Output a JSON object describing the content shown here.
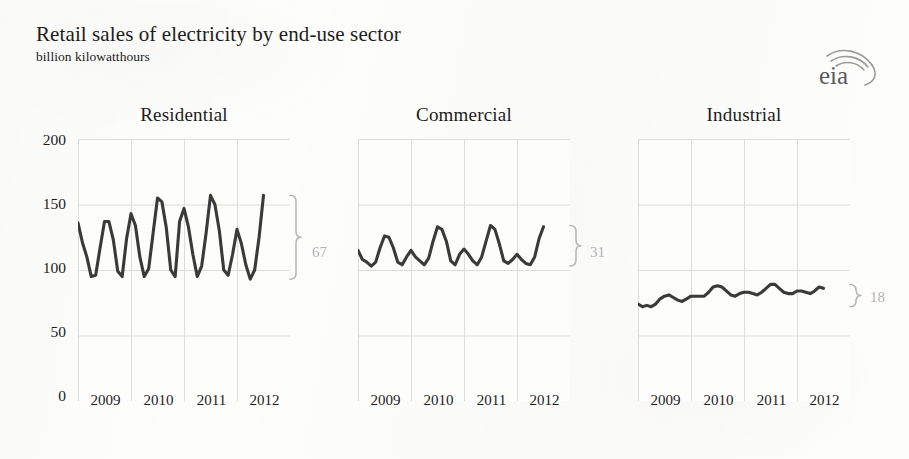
{
  "header": {
    "title": "Retail sales of electricity by end-use sector",
    "subtitle": "billion kilowatthours",
    "logo_text": "eia",
    "logo_name": "eia-logo"
  },
  "axis": {
    "y_ticks": [
      "200",
      "150",
      "100",
      "50",
      "0"
    ],
    "y_values": [
      200,
      150,
      100,
      50,
      0
    ],
    "x_ticks": [
      "2009",
      "2010",
      "2011",
      "2012"
    ]
  },
  "panels": [
    {
      "title": "Residential",
      "range_label": "67"
    },
    {
      "title": "Commercial",
      "range_label": "31"
    },
    {
      "title": "Industrial",
      "range_label": "18"
    }
  ],
  "colors": {
    "line": "#3a3a3a",
    "grid": "#dcdcd8",
    "paper": "#fdfdfb",
    "annotation": "#b4b4b4",
    "text": "#1d1d1d"
  },
  "chart_data": {
    "type": "line",
    "title": "Retail sales of electricity by end-use sector",
    "subtitle": "billion kilowatthours",
    "xlabel": "",
    "ylabel": "billion kilowatthours",
    "ylim": [
      0,
      200
    ],
    "yticks": [
      0,
      50,
      100,
      150,
      200
    ],
    "grid": true,
    "legend": "none",
    "xtick_labels": [
      "2009",
      "2010",
      "2011",
      "2012"
    ],
    "x_start": "2008-07",
    "x_end": "2012-07",
    "x_frequency": "monthly",
    "panels": [
      {
        "name": "Residential",
        "annotation": "67",
        "annotation_meaning": "average seasonal peak-to-trough range, billion kWh",
        "x": [
          "2008-07",
          "2008-08",
          "2008-09",
          "2008-10",
          "2008-11",
          "2008-12",
          "2009-01",
          "2009-02",
          "2009-03",
          "2009-04",
          "2009-05",
          "2009-06",
          "2009-07",
          "2009-08",
          "2009-09",
          "2009-10",
          "2009-11",
          "2009-12",
          "2010-01",
          "2010-02",
          "2010-03",
          "2010-04",
          "2010-05",
          "2010-06",
          "2010-07",
          "2010-08",
          "2010-09",
          "2010-10",
          "2010-11",
          "2010-12",
          "2011-01",
          "2011-02",
          "2011-03",
          "2011-04",
          "2011-05",
          "2011-06",
          "2011-07",
          "2011-08",
          "2011-09",
          "2011-10",
          "2011-11",
          "2011-12",
          "2012-01",
          "2012-02",
          "2012-03",
          "2012-04",
          "2012-05",
          "2012-06",
          "2012-07"
        ],
        "values": [
          138,
          136,
          124,
          102,
          95,
          119,
          136,
          121,
          110,
          95,
          96,
          117,
          137,
          137,
          123,
          99,
          95,
          124,
          143,
          134,
          110,
          95,
          101,
          128,
          155,
          152,
          132,
          100,
          95,
          137,
          147,
          133,
          112,
          95,
          103,
          128,
          157,
          150,
          130,
          100,
          96,
          112,
          131,
          120,
          104,
          93,
          100,
          125,
          157
        ]
      },
      {
        "name": "Commercial",
        "annotation": "31",
        "annotation_meaning": "average seasonal peak-to-trough range, billion kWh",
        "x": [
          "2008-07",
          "2008-08",
          "2008-09",
          "2008-10",
          "2008-11",
          "2008-12",
          "2009-01",
          "2009-02",
          "2009-03",
          "2009-04",
          "2009-05",
          "2009-06",
          "2009-07",
          "2009-08",
          "2009-09",
          "2009-10",
          "2009-11",
          "2009-12",
          "2010-01",
          "2010-02",
          "2010-03",
          "2010-04",
          "2010-05",
          "2010-06",
          "2010-07",
          "2010-08",
          "2010-09",
          "2010-10",
          "2010-11",
          "2010-12",
          "2011-01",
          "2011-02",
          "2011-03",
          "2011-04",
          "2011-05",
          "2011-06",
          "2011-07",
          "2011-08",
          "2011-09",
          "2011-10",
          "2011-11",
          "2011-12",
          "2012-01",
          "2012-02",
          "2012-03",
          "2012-04",
          "2012-05",
          "2012-06",
          "2012-07"
        ],
        "values": [
          112,
          111,
          108,
          103,
          103,
          109,
          115,
          108,
          106,
          103,
          106,
          117,
          126,
          125,
          117,
          106,
          104,
          110,
          115,
          110,
          107,
          104,
          109,
          122,
          133,
          131,
          122,
          107,
          104,
          112,
          116,
          112,
          107,
          104,
          110,
          122,
          134,
          131,
          120,
          107,
          105,
          108,
          112,
          108,
          105,
          104,
          110,
          124,
          133
        ]
      },
      {
        "name": "Industrial",
        "annotation": "18",
        "annotation_meaning": "average seasonal peak-to-trough range, billion kWh",
        "x": [
          "2008-07",
          "2008-08",
          "2008-09",
          "2008-10",
          "2008-11",
          "2008-12",
          "2009-01",
          "2009-02",
          "2009-03",
          "2009-04",
          "2009-05",
          "2009-06",
          "2009-07",
          "2009-08",
          "2009-09",
          "2009-10",
          "2009-11",
          "2009-12",
          "2010-01",
          "2010-02",
          "2010-03",
          "2010-04",
          "2010-05",
          "2010-06",
          "2010-07",
          "2010-08",
          "2010-09",
          "2010-10",
          "2010-11",
          "2010-12",
          "2011-01",
          "2011-02",
          "2011-03",
          "2011-04",
          "2011-05",
          "2011-06",
          "2011-07",
          "2011-08",
          "2011-09",
          "2011-10",
          "2011-11",
          "2011-12",
          "2012-01",
          "2012-02",
          "2012-03",
          "2012-04",
          "2012-05",
          "2012-06",
          "2012-07"
        ],
        "values": [
          74,
          80,
          78,
          75,
          72,
          73,
          74,
          72,
          73,
          72,
          74,
          78,
          80,
          81,
          79,
          77,
          76,
          78,
          80,
          80,
          80,
          80,
          83,
          87,
          88,
          87,
          84,
          81,
          80,
          82,
          83,
          83,
          82,
          81,
          83,
          86,
          89,
          89,
          86,
          83,
          82,
          82,
          84,
          84,
          83,
          82,
          84,
          87,
          86
        ]
      }
    ]
  }
}
